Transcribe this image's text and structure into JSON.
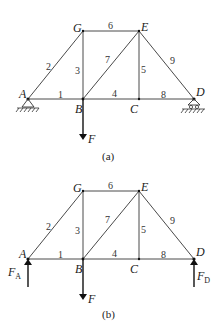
{
  "diagrams": [
    {
      "caption": "(a)",
      "nodes": {
        "A": "A",
        "G": "G",
        "E": "E",
        "B": "B",
        "C": "C",
        "D": "D"
      },
      "members": {
        "m1": "1",
        "m2": "2",
        "m3": "3",
        "m4": "4",
        "m5": "5",
        "m6": "6",
        "m7": "7",
        "m8": "8",
        "m9": "9"
      },
      "supports": {
        "A": "pinned (fixed hinge)",
        "D": "roller"
      },
      "load": {
        "label": "F",
        "at": "B",
        "direction": "down"
      }
    },
    {
      "caption": "(b)",
      "nodes": {
        "A": "A",
        "G": "G",
        "E": "E",
        "B": "B",
        "C": "C",
        "D": "D"
      },
      "members": {
        "m1": "1",
        "m2": "2",
        "m3": "3",
        "m4": "4",
        "m5": "5",
        "m6": "6",
        "m7": "7",
        "m8": "8",
        "m9": "9"
      },
      "reactions": {
        "FA": {
          "main": "F",
          "sub": "A",
          "at": "A",
          "direction": "up"
        },
        "FD": {
          "main": "F",
          "sub": "D",
          "at": "D",
          "direction": "up"
        }
      },
      "load": {
        "label": "F",
        "at": "B",
        "direction": "down"
      }
    }
  ]
}
